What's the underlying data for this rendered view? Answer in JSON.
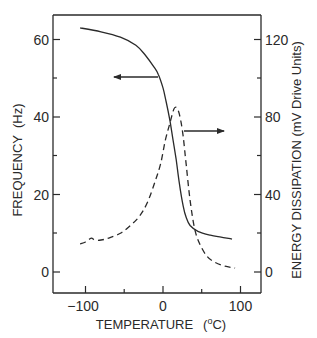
{
  "chart_data": {
    "type": "line",
    "title": "",
    "xlabel": "TEMPERATURE (°C)",
    "ylabel": "FREQUENCY (Hz)",
    "y2label": "ENERGY DISSIPATION (mV Drive Units)",
    "xlim": [
      -125,
      125
    ],
    "ylim": [
      -6,
      66
    ],
    "y2lim": [
      -12,
      132
    ],
    "x_ticks": [
      -100,
      0,
      100
    ],
    "x_minor_ticks": [
      -50,
      50
    ],
    "y_ticks": [
      0,
      20,
      40,
      60
    ],
    "y_minor_ticks": [
      10,
      30,
      50
    ],
    "y2_ticks": [
      0,
      40,
      80,
      120
    ],
    "y2_minor_ticks": [
      20,
      60,
      100
    ],
    "grid": false,
    "legend": "none (arrows indicate axis for each curve)",
    "series": [
      {
        "name": "Frequency",
        "axis": "left",
        "style": "solid",
        "x": [
          -107,
          -80,
          -55,
          -35,
          -23,
          -12,
          -6,
          0,
          4,
          9,
          13,
          17,
          21,
          26,
          30,
          35,
          45,
          61,
          75,
          89
        ],
        "values": [
          63,
          62,
          60.6,
          58.5,
          56,
          53,
          51,
          47.5,
          44,
          39,
          34,
          29,
          23,
          17,
          14,
          12,
          10.5,
          9.5,
          9,
          8.5
        ]
      },
      {
        "name": "Energy Dissipation",
        "axis": "right",
        "style": "dashed",
        "x": [
          -107,
          -100,
          -95,
          -92,
          -88,
          -80,
          -70,
          -55,
          -42,
          -30,
          -20,
          -10,
          -3,
          3,
          9,
          14,
          17,
          20,
          23,
          26,
          30,
          35,
          41,
          48,
          57,
          67,
          80,
          93
        ],
        "values": [
          14.5,
          15.5,
          17,
          17.5,
          16.5,
          16.5,
          17.5,
          20,
          24,
          29,
          36,
          47,
          56,
          68,
          77,
          84,
          85,
          83,
          78,
          70,
          55,
          37,
          22,
          14,
          8,
          5,
          3,
          2
        ]
      }
    ],
    "annotations": [
      {
        "type": "arrow",
        "direction": "left",
        "from_series": "Frequency",
        "at_x": -6,
        "y": 50,
        "meaning": "Frequency uses left axis"
      },
      {
        "type": "arrow",
        "direction": "right",
        "from_series": "Energy Dissipation",
        "at_x": 27,
        "y": 73,
        "meaning": "Energy Dissipation uses right axis"
      }
    ]
  },
  "axes": {
    "x_tick_labels": [
      "−100",
      "0",
      "100"
    ],
    "y_tick_labels": [
      "0",
      "20",
      "40",
      "60"
    ],
    "y2_tick_labels": [
      "0",
      "40",
      "80",
      "120"
    ],
    "x_title_main": "TEMPERATURE",
    "x_title_unit_open": "(",
    "x_title_unit_sup": "o",
    "x_title_unit_close": "C)",
    "y_title": "FREQUENCY  (Hz)",
    "y2_title": "ENERGY DISSIPATION (mV Drive Units)"
  },
  "colors": {
    "ink": "#2a2a2a",
    "background": "#ffffff"
  }
}
